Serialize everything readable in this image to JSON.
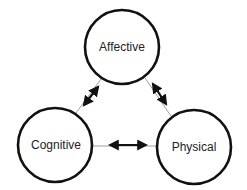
{
  "diagram": {
    "nodes": [
      {
        "id": "affective",
        "label": "Affective",
        "cx": 122,
        "cy": 47,
        "r": 38
      },
      {
        "id": "cognitive",
        "label": "Cognitive",
        "cx": 55,
        "cy": 145,
        "r": 38
      },
      {
        "id": "physical",
        "label": "Physical",
        "cx": 194,
        "cy": 147,
        "r": 38
      }
    ],
    "edges": [
      {
        "from": "affective",
        "to": "cognitive",
        "type": "bidirectional"
      },
      {
        "from": "affective",
        "to": "physical",
        "type": "bidirectional"
      },
      {
        "from": "cognitive",
        "to": "physical",
        "type": "bidirectional"
      }
    ],
    "colors": {
      "stroke": "#111111",
      "background": "#ffffff",
      "text": "#222222"
    }
  }
}
